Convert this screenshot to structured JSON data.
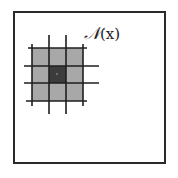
{
  "diagram": {
    "label_symbol": "𝒩",
    "label_arg": "(x)",
    "center_mark": "x",
    "grid": {
      "rows": 3,
      "cols": 3,
      "center_cell": [
        1,
        1
      ]
    },
    "colors": {
      "frame": "#2a2a2a",
      "neighbor_fill": "#a8a8a8",
      "center_fill": "#3c3c3c",
      "grid_lines": "#1e1e1e",
      "background": "#ffffff"
    }
  }
}
